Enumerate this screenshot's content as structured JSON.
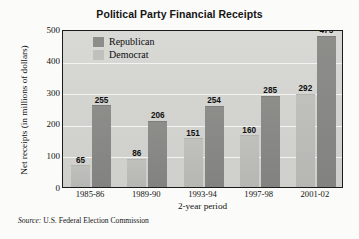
{
  "chart_data": {
    "type": "bar",
    "title": "Political Party Financial Receipts",
    "xlabel": "2-year period",
    "ylabel": "Net receipts (in millions of dollars)",
    "categories": [
      "1985-86",
      "1989-90",
      "1993-94",
      "1997-98",
      "2001-02"
    ],
    "series": [
      {
        "name": "Republican",
        "color": "#8d8d8a",
        "values": [
          255,
          206,
          254,
          285,
          475
        ]
      },
      {
        "name": "Democrat",
        "color": "#c0c0bd",
        "values": [
          65,
          86,
          151,
          160,
          292
        ]
      }
    ],
    "bar_order": [
      "Democrat",
      "Republican"
    ],
    "ylim": [
      0,
      500
    ],
    "yticks": [
      500,
      400,
      300,
      200,
      100,
      0
    ],
    "grid": true,
    "legend_position": "top-left-inside"
  },
  "source": {
    "label": "Source:",
    "text": "U.S. Federal Election Commission"
  }
}
